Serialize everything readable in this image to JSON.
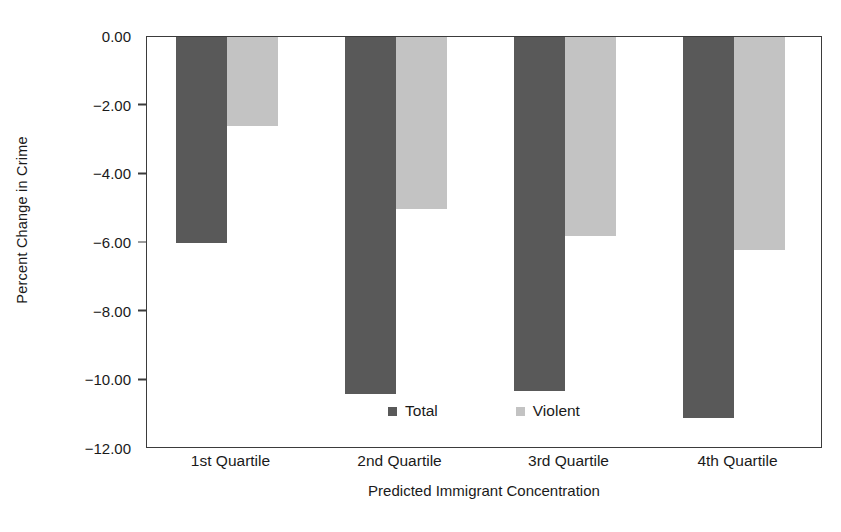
{
  "chart_data": {
    "type": "bar",
    "title": "",
    "xlabel": "Predicted Immigrant Concentration",
    "ylabel": "Percent Change in Crime",
    "categories": [
      "1st Quartile",
      "2nd Quartile",
      "3rd Quartile",
      "4th Quartile"
    ],
    "series": [
      {
        "name": "Total",
        "color": "#595959",
        "values": [
          -6.0,
          -10.4,
          -10.3,
          -11.1
        ]
      },
      {
        "name": "Violent",
        "color": "#c3c3c3",
        "values": [
          -2.6,
          -5.0,
          -5.8,
          -6.2
        ]
      }
    ],
    "ylim": [
      -12.0,
      0.0
    ],
    "ytick_labels": [
      "0.00",
      "-2.00",
      "-4.00",
      "-6.00",
      "-8.00",
      "-10.00",
      "-12.00"
    ],
    "ytick_values": [
      0.0,
      -2.0,
      -4.0,
      -6.0,
      -8.0,
      -10.0,
      -12.0
    ],
    "grid": false,
    "legend_position": "inside-bottom-center",
    "frame": true
  },
  "colors": {
    "total": "#595959",
    "violent": "#c3c3c3",
    "axis": "#3b3b3b",
    "text": "#1a1a1a",
    "background": "#ffffff"
  }
}
